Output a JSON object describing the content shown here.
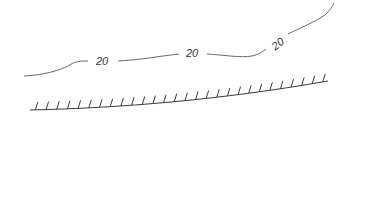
{
  "map_symbols": {
    "contour_line": {
      "labels": [
        {
          "text": "20",
          "x": 103,
          "y": 65,
          "rotate": 0
        },
        {
          "text": "20",
          "x": 193,
          "y": 57,
          "rotate": 0
        },
        {
          "text": "20",
          "x": 277,
          "y": 46,
          "rotate": -38
        }
      ],
      "stroke_color": "#6a6a6a"
    },
    "embankment_line": {
      "tick_count": 28,
      "stroke_color": "#3a3a3a"
    }
  }
}
